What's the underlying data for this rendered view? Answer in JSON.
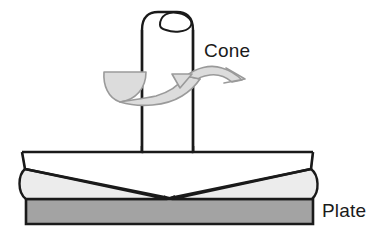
{
  "figure": {
    "type": "technical-line-diagram",
    "background_color": "#FFFFFF",
    "stroke_color": "#1A1A1A",
    "arrow_stroke_color": "#8C8C8C",
    "weld_fill_color": "#ECECEC",
    "plate_fill_color": "#A3A3A3",
    "arrow_fill_color": "#DCDCDC"
  },
  "labels": {
    "cone": "Cone",
    "plate": "Plate"
  },
  "parts": [
    {
      "name": "cone-tool",
      "label": "Cone",
      "description": "Vertical cylindrical rotating tool with rounded top face"
    },
    {
      "name": "rotation-arrow",
      "label": "",
      "description": "Curved ribbon arrow around the cone shaft indicating rotation"
    },
    {
      "name": "weld-bead",
      "label": "",
      "description": "Light gray raised weld material with V-groove profile"
    },
    {
      "name": "base-plate",
      "label": "Plate",
      "description": "Dark gray horizontal base plate"
    }
  ],
  "geometry": {
    "cone_shaft_left_x": 142,
    "cone_shaft_right_x": 193,
    "cone_top_y": 14,
    "plate_top_y": 152,
    "plate_left_x": 22,
    "plate_right_x": 313,
    "weld_bottom_y": 199,
    "base_plate_bottom_y": 224
  }
}
